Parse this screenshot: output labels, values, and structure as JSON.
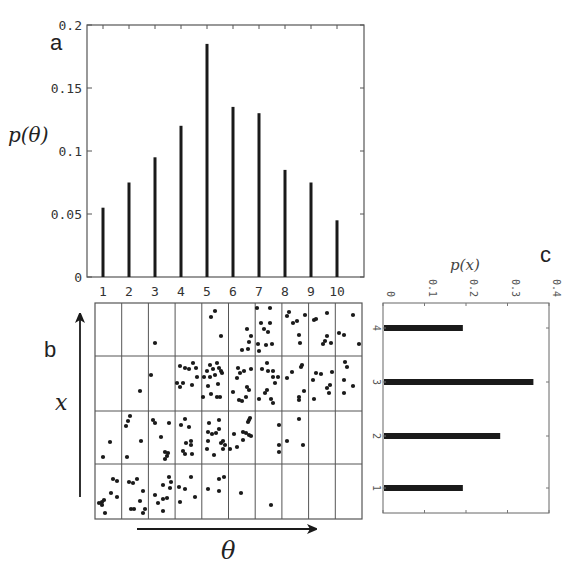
{
  "chart_data": [
    {
      "panel": "a",
      "type": "bar",
      "title": "",
      "xlabel": "",
      "ylabel": "p(θ)",
      "categories": [
        "1",
        "2",
        "3",
        "4",
        "5",
        "6",
        "7",
        "8",
        "9",
        "10"
      ],
      "values": [
        0.055,
        0.075,
        0.095,
        0.12,
        0.185,
        0.135,
        0.13,
        0.085,
        0.075,
        0.045
      ],
      "ylim": [
        0,
        0.2
      ],
      "yticks": [
        "0",
        "0.05",
        "0.1",
        "0.15",
        "0.2"
      ],
      "grid": false
    },
    {
      "panel": "b",
      "type": "scatter",
      "title": "",
      "xlabel": "θ",
      "ylabel": "x",
      "grid_columns": 10,
      "grid_rows": 4,
      "description": "Joint samples of (θ, x) binned into a 10×4 grid; density concentrates along a rising diagonal",
      "cell_counts_by_row": {
        "x4": [
          0,
          0,
          1,
          0,
          3,
          5,
          10,
          7,
          7,
          4
        ],
        "x3": [
          0,
          1,
          1,
          10,
          16,
          11,
          12,
          7,
          8,
          5
        ],
        "x2": [
          2,
          5,
          8,
          9,
          13,
          11,
          3,
          3,
          0,
          0
        ],
        "x1": [
          9,
          9,
          9,
          5,
          4,
          1,
          1,
          0,
          0,
          0
        ]
      }
    },
    {
      "panel": "c",
      "type": "bar",
      "orientation": "horizontal",
      "title": "",
      "xlabel": "p(x)",
      "ylabel": "",
      "categories": [
        "1",
        "2",
        "3",
        "4"
      ],
      "values": [
        0.19,
        0.28,
        0.36,
        0.19
      ],
      "xlim": [
        0,
        0.4
      ],
      "xticks": [
        "0",
        "0.1",
        "0.2",
        "0.3",
        "0.4"
      ],
      "grid": false
    }
  ],
  "labels": {
    "panel_a": "a",
    "panel_b": "b",
    "panel_c": "c",
    "a_ylabel": "p(θ)",
    "b_xlabel": "θ",
    "b_ylabel": "x",
    "c_label": "p(x)"
  },
  "colors": {
    "bar": "#1a1a1a",
    "axis": "#555555",
    "dot": "#1a1a1a"
  },
  "dots": [
    [
      155,
      343
    ],
    [
      211,
      317
    ],
    [
      215,
      311
    ],
    [
      221,
      336
    ],
    [
      247,
      329
    ],
    [
      251,
      336
    ],
    [
      249,
      342
    ],
    [
      242,
      350
    ],
    [
      248,
      349
    ],
    [
      257,
      308
    ],
    [
      270,
      308
    ],
    [
      261,
      323
    ],
    [
      270,
      323
    ],
    [
      264,
      329
    ],
    [
      268,
      332
    ],
    [
      258,
      344
    ],
    [
      259,
      351
    ],
    [
      266,
      345
    ],
    [
      272,
      344
    ],
    [
      287,
      316
    ],
    [
      289,
      312
    ],
    [
      293,
      323
    ],
    [
      297,
      321
    ],
    [
      305,
      315
    ],
    [
      299,
      335
    ],
    [
      300,
      343
    ],
    [
      314,
      320
    ],
    [
      316,
      319
    ],
    [
      327,
      313
    ],
    [
      327,
      336
    ],
    [
      325,
      341
    ],
    [
      323,
      344
    ],
    [
      331,
      343
    ],
    [
      353,
      315
    ],
    [
      339,
      333
    ],
    [
      344,
      335
    ],
    [
      359,
      344
    ],
    [
      151,
      375
    ],
    [
      140,
      391
    ],
    [
      180,
      366
    ],
    [
      185,
      368
    ],
    [
      189,
      369
    ],
    [
      193,
      363
    ],
    [
      196,
      368
    ],
    [
      197,
      377
    ],
    [
      177,
      383
    ],
    [
      183,
      383
    ],
    [
      180,
      387
    ],
    [
      192,
      385
    ],
    [
      204,
      377
    ],
    [
      207,
      371
    ],
    [
      210,
      365
    ],
    [
      213,
      369
    ],
    [
      217,
      363
    ],
    [
      219,
      368
    ],
    [
      221,
      371
    ],
    [
      215,
      375
    ],
    [
      210,
      377
    ],
    [
      218,
      384
    ],
    [
      208,
      386
    ],
    [
      203,
      397
    ],
    [
      211,
      394
    ],
    [
      217,
      397
    ],
    [
      220,
      397
    ],
    [
      222,
      373
    ],
    [
      238,
      368
    ],
    [
      244,
      371
    ],
    [
      251,
      369
    ],
    [
      240,
      373
    ],
    [
      237,
      378
    ],
    [
      233,
      392
    ],
    [
      247,
      387
    ],
    [
      249,
      390
    ],
    [
      246,
      397
    ],
    [
      239,
      400
    ],
    [
      242,
      401
    ],
    [
      262,
      369
    ],
    [
      267,
      363
    ],
    [
      268,
      371
    ],
    [
      273,
      371
    ],
    [
      273,
      377
    ],
    [
      278,
      377
    ],
    [
      275,
      383
    ],
    [
      267,
      390
    ],
    [
      265,
      393
    ],
    [
      271,
      399
    ],
    [
      273,
      403
    ],
    [
      259,
      399
    ],
    [
      287,
      378
    ],
    [
      292,
      372
    ],
    [
      302,
      365
    ],
    [
      301,
      367
    ],
    [
      304,
      391
    ],
    [
      299,
      397
    ],
    [
      299,
      400
    ],
    [
      316,
      373
    ],
    [
      321,
      374
    ],
    [
      313,
      380
    ],
    [
      332,
      372
    ],
    [
      330,
      385
    ],
    [
      327,
      388
    ],
    [
      329,
      393
    ],
    [
      314,
      399
    ],
    [
      345,
      362
    ],
    [
      347,
      367
    ],
    [
      344,
      380
    ],
    [
      353,
      386
    ],
    [
      344,
      393
    ],
    [
      110,
      442
    ],
    [
      103,
      457
    ],
    [
      130,
      416
    ],
    [
      128,
      421
    ],
    [
      126,
      426
    ],
    [
      141,
      441
    ],
    [
      127,
      457
    ],
    [
      153,
      420
    ],
    [
      155,
      423
    ],
    [
      169,
      423
    ],
    [
      161,
      437
    ],
    [
      165,
      452
    ],
    [
      168,
      453
    ],
    [
      167,
      456
    ],
    [
      165,
      459
    ],
    [
      181,
      425
    ],
    [
      185,
      419
    ],
    [
      189,
      427
    ],
    [
      186,
      443
    ],
    [
      191,
      441
    ],
    [
      191,
      445
    ],
    [
      183,
      451
    ],
    [
      185,
      454
    ],
    [
      192,
      454
    ],
    [
      209,
      423
    ],
    [
      219,
      420
    ],
    [
      208,
      432
    ],
    [
      212,
      434
    ],
    [
      216,
      433
    ],
    [
      219,
      429
    ],
    [
      208,
      441
    ],
    [
      207,
      449
    ],
    [
      214,
      455
    ],
    [
      221,
      443
    ],
    [
      223,
      441
    ],
    [
      225,
      445
    ],
    [
      223,
      449
    ],
    [
      250,
      418
    ],
    [
      249,
      420
    ],
    [
      248,
      422
    ],
    [
      234,
      434
    ],
    [
      243,
      432
    ],
    [
      246,
      433
    ],
    [
      249,
      435
    ],
    [
      251,
      436
    ],
    [
      243,
      440
    ],
    [
      237,
      447
    ],
    [
      230,
      449
    ],
    [
      279,
      425
    ],
    [
      279,
      445
    ],
    [
      279,
      452
    ],
    [
      287,
      441
    ],
    [
      299,
      419
    ],
    [
      303,
      445
    ],
    [
      113,
      479
    ],
    [
      117,
      481
    ],
    [
      111,
      493
    ],
    [
      117,
      497
    ],
    [
      102,
      502
    ],
    [
      99,
      503
    ],
    [
      104,
      500
    ],
    [
      102,
      505
    ],
    [
      105,
      513
    ],
    [
      129,
      482
    ],
    [
      133,
      483
    ],
    [
      137,
      479
    ],
    [
      143,
      491
    ],
    [
      140,
      501
    ],
    [
      131,
      509
    ],
    [
      134,
      509
    ],
    [
      145,
      509
    ],
    [
      143,
      513
    ],
    [
      155,
      495
    ],
    [
      158,
      503
    ],
    [
      163,
      485
    ],
    [
      169,
      477
    ],
    [
      171,
      482
    ],
    [
      170,
      488
    ],
    [
      163,
      499
    ],
    [
      167,
      498
    ],
    [
      163,
      511
    ],
    [
      179,
      487
    ],
    [
      185,
      489
    ],
    [
      191,
      477
    ],
    [
      180,
      502
    ],
    [
      195,
      497
    ],
    [
      208,
      489
    ],
    [
      219,
      491
    ],
    [
      219,
      479
    ],
    [
      224,
      477
    ],
    [
      241,
      493
    ],
    [
      271,
      505
    ]
  ]
}
